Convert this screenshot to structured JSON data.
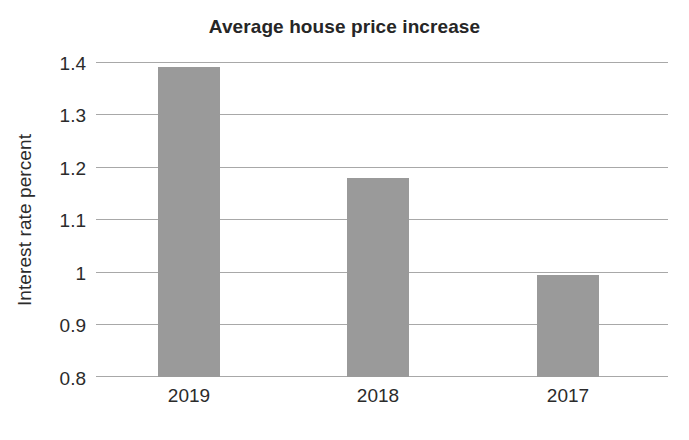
{
  "chart_data": {
    "type": "bar",
    "title": "Average house price increase",
    "xlabel": "",
    "ylabel": "Interest rate percent",
    "categories": [
      "2019",
      "2018",
      "2017"
    ],
    "values": [
      1.39,
      1.18,
      0.995
    ],
    "series": [
      {
        "name": "Interest rate percent",
        "values": [
          1.39,
          1.18,
          0.995
        ]
      }
    ],
    "ylim": [
      0.8,
      1.4
    ],
    "yticks": [
      1.4,
      1.3,
      1.2,
      1.1,
      1,
      0.9,
      0.8
    ],
    "ytick_labels": [
      "1.4",
      "1.3",
      "1.2",
      "1.1",
      "1",
      "0.9",
      "0.8"
    ],
    "grid": true,
    "legend": false,
    "legend_position": "none",
    "bar_color": "#9a9a9a",
    "gridline_color": "#a8a8a8",
    "background_color": "#ffffff",
    "text_color": "#2b2b2b"
  }
}
